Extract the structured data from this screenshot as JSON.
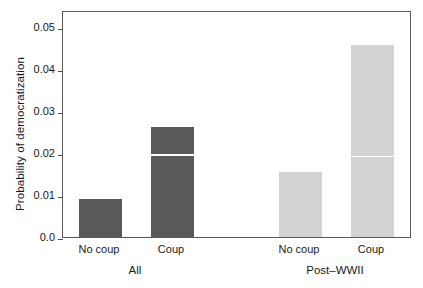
{
  "chart_data": {
    "type": "bar",
    "title": "",
    "xlabel": "",
    "ylabel": "Probability of democratization",
    "ylim": [
      0.0,
      0.052
    ],
    "grid": false,
    "legend": "none",
    "y_ticks": [
      "0.0",
      "0.01",
      "0.02",
      "0.03",
      "0.04",
      "0.05"
    ],
    "y_tick_values": [
      0.0,
      0.01,
      0.02,
      0.03,
      0.04,
      0.05
    ],
    "groups": [
      {
        "name": "All",
        "label": "All"
      },
      {
        "name": "Post-WWII",
        "label": "Post–WWII"
      }
    ],
    "categories": [
      "No coup",
      "Coup",
      "No coup",
      "Coup"
    ],
    "values": [
      0.009,
      0.0262,
      0.0155,
      0.0457
    ],
    "bars": [
      {
        "group": "All",
        "category": "No coup",
        "value": 0.009,
        "color": "#595959",
        "inner_line": null
      },
      {
        "group": "All",
        "category": "Coup",
        "value": 0.0262,
        "color": "#595959",
        "inner_line": 0.0193
      },
      {
        "group": "Post–WWII",
        "category": "No coup",
        "value": 0.0155,
        "color": "#d3d3d3",
        "inner_line": null
      },
      {
        "group": "Post–WWII",
        "category": "Coup",
        "value": 0.0457,
        "color": "#d3d3d3",
        "inner_line": 0.019
      }
    ],
    "colors": {
      "all_group": "#595959",
      "postwwii_group": "#d3d3d3",
      "axis": "#5a5a5a",
      "text": "#1a1a1a"
    }
  }
}
